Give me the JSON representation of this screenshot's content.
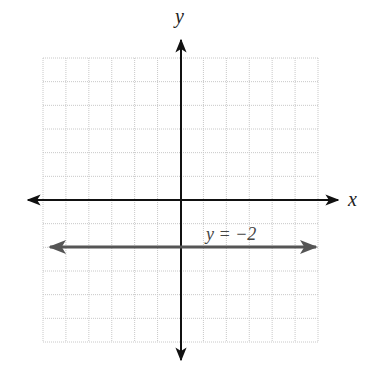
{
  "chart_data": {
    "type": "line",
    "title": "",
    "xlabel": "x",
    "ylabel": "y",
    "xlim": [
      -6,
      6
    ],
    "ylim": [
      -6,
      6
    ],
    "grid": true,
    "grid_cells": {
      "columns": 12,
      "rows": 12
    },
    "series": [
      {
        "name": "y = -2",
        "equation": "y = -2",
        "kind": "horizontal line",
        "points": [
          [
            -5.5,
            -2
          ],
          [
            5.5,
            -2
          ]
        ],
        "arrows": "both ends",
        "color": "#555555"
      }
    ],
    "annotations": [
      {
        "text": "y = −2",
        "x": 2.2,
        "y": -1.3
      }
    ]
  },
  "labels": {
    "x_axis": "x",
    "y_axis": "y",
    "line_label": "y = −2"
  },
  "colors": {
    "grid": "#c8c8c8",
    "axes": "#111111",
    "line": "#555555",
    "background": "#ffffff"
  }
}
